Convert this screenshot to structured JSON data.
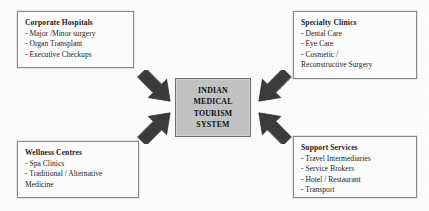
{
  "diagram": {
    "title": "Indian Medical Tourism System",
    "hub": {
      "name": "indian-medical-tourism-system",
      "lines": [
        "INDIAN",
        "MEDICAL",
        "TOURISM",
        "SYSTEM"
      ],
      "fill_color": "#c2c2c2",
      "border_color": "#6e6e6e"
    },
    "nodes": [
      {
        "id": "corporate-hospitals",
        "title": "Corporate Hospitals",
        "items": [
          "- Major /Minor surgery",
          "- Organ Transplant",
          "- Executive Checkups"
        ],
        "position": "top-left"
      },
      {
        "id": "specialty-clinics",
        "title": "Specialty Clinics",
        "items": [
          "- Dental Care",
          "- Eye Care",
          "- Cosmetic /",
          "Reconstructive Surgery"
        ],
        "position": "top-right"
      },
      {
        "id": "wellness-centres",
        "title": "Wellness Centres",
        "items": [
          "- Spa Clinics",
          "- Traditional / Alternative",
          "Medicine"
        ],
        "position": "bottom-left"
      },
      {
        "id": "support-services",
        "title": "Support Services",
        "items": [
          "- Travel Intermediaries",
          "- Service Brokers",
          "- Hotel / Restaurant",
          "- Transport"
        ],
        "position": "bottom-right"
      }
    ],
    "arrows": [
      {
        "id": "arrow-corporate-hospitals-to-hub",
        "direction": "down-right",
        "from": "corporate-hospitals",
        "to": "indian-medical-tourism-system"
      },
      {
        "id": "arrow-specialty-clinics-to-hub",
        "direction": "down-left",
        "from": "specialty-clinics",
        "to": "indian-medical-tourism-system"
      },
      {
        "id": "arrow-wellness-centres-to-hub",
        "direction": "up-right",
        "from": "wellness-centres",
        "to": "indian-medical-tourism-system"
      },
      {
        "id": "arrow-support-services-to-hub",
        "direction": "up-left",
        "from": "support-services",
        "to": "indian-medical-tourism-system"
      }
    ],
    "colors": {
      "node_fill": "#fbfbfb",
      "node_border": "#8a8a8a",
      "arrow_fill": "#3a3a3a",
      "background": "#fdfdfd",
      "text": "#1b1b1b"
    }
  }
}
